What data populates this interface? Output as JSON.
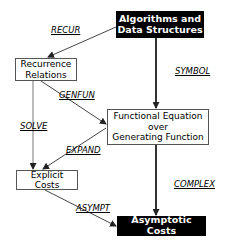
{
  "diagram": {
    "nodes": [
      {
        "id": "algorithms",
        "label": "Algorithms and\nData Structures",
        "style": "dark"
      },
      {
        "id": "recurrence",
        "label": "Recurrence\nRelations",
        "style": "light"
      },
      {
        "id": "functional",
        "label": "Functional Equation\nover\nGenerating Function",
        "style": "light"
      },
      {
        "id": "explicit",
        "label": "Explicit Costs",
        "style": "light"
      },
      {
        "id": "asymptotic",
        "label": "Asymptotic Costs",
        "style": "dark"
      }
    ],
    "edges": [
      {
        "from": "algorithms",
        "to": "recurrence",
        "label": "RECUR"
      },
      {
        "from": "algorithms",
        "to": "functional",
        "label": "SYMBOL"
      },
      {
        "from": "recurrence",
        "to": "functional",
        "label": "GENFUN"
      },
      {
        "from": "recurrence",
        "to": "explicit",
        "label": "SOLVE"
      },
      {
        "from": "functional",
        "to": "explicit",
        "label": "EXPAND"
      },
      {
        "from": "functional",
        "to": "asymptotic",
        "label": "COMPLEX"
      },
      {
        "from": "explicit",
        "to": "asymptotic",
        "label": "ASYMPT"
      }
    ]
  },
  "colors": {
    "dark_fill": "#000000",
    "light_fill": "#ffffff",
    "line": "#333333"
  }
}
